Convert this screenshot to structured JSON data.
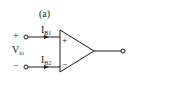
{
  "figure": {
    "panel_label": "(a)",
    "input_plus_sign": "+",
    "input_minus_sign": "−",
    "voltage_label": {
      "main": "V",
      "sub": "io"
    },
    "current_top": {
      "main": "I",
      "sub": "B1"
    },
    "current_bottom": {
      "main": "I",
      "sub": "B2"
    },
    "opamp_plus": "+",
    "opamp_minus": "−",
    "colors": {
      "line": "#1a1a1a",
      "background": "#ffffff"
    }
  }
}
